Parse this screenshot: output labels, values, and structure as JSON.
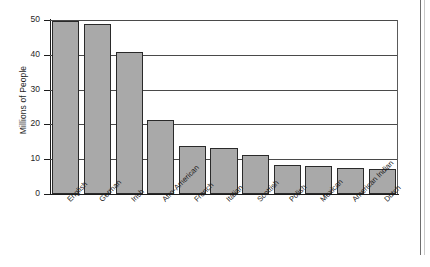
{
  "chart_data": {
    "type": "bar",
    "title": "",
    "xlabel": "",
    "ylabel": "Millions of People",
    "ylim": [
      0,
      50
    ],
    "yticks": [
      0,
      10,
      20,
      30,
      40,
      50
    ],
    "ytick_labels": [
      "0",
      "10",
      "20",
      "30",
      "40",
      "50"
    ],
    "grid": true,
    "legend": "none",
    "orientation": "vertical",
    "bar_color": "#a9a9a9",
    "bar_edge_color": "#2a2a2a",
    "categories": [
      "English",
      "German",
      "Irish",
      "Afro-American",
      "French",
      "Italian",
      "Scottish",
      "Polish",
      "Mexican",
      "American Indian",
      "Dutch"
    ],
    "values": [
      49.6,
      48.8,
      40.7,
      21.3,
      13.8,
      13.3,
      11.2,
      8.4,
      8.1,
      7.6,
      7.2
    ]
  }
}
